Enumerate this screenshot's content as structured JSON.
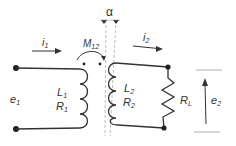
{
  "diagram": {
    "type": "transformer-circuit",
    "labels": {
      "i1_main": "i",
      "i1_sub": "1",
      "i2_main": "i",
      "i2_sub": "2",
      "m12_main": "M",
      "m12_sub": "12",
      "alpha": "α",
      "e1_main": "e",
      "e1_sub": "1",
      "e2_main": "e",
      "e2_sub": "2",
      "L1_main": "L",
      "L1_sub": "1",
      "R1_main": "R",
      "R1_sub": "1",
      "L2_main": "L",
      "L2_sub": "2",
      "R2_main": "R",
      "R2_sub": "2",
      "RL_main": "R",
      "RL_sub": "L"
    },
    "colors": {
      "stroke": "#333333",
      "dashed": "#aaaaaa",
      "background": "#ffffff"
    }
  }
}
